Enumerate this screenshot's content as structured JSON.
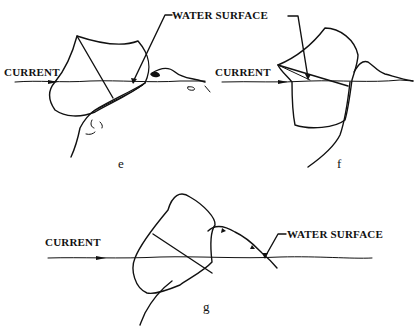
{
  "figure": {
    "panels": [
      {
        "id": "e",
        "letter": "e",
        "current_label": "CURRENT"
      },
      {
        "id": "f",
        "letter": "f",
        "current_label": "CURRENT"
      },
      {
        "id": "g",
        "letter": "g",
        "current_label": "CURRENT",
        "water_label": "WATER SURFACE"
      }
    ],
    "top_water_label": "WATER SURFACE",
    "colors": {
      "ink": "#111111",
      "background": "#ffffff"
    }
  }
}
